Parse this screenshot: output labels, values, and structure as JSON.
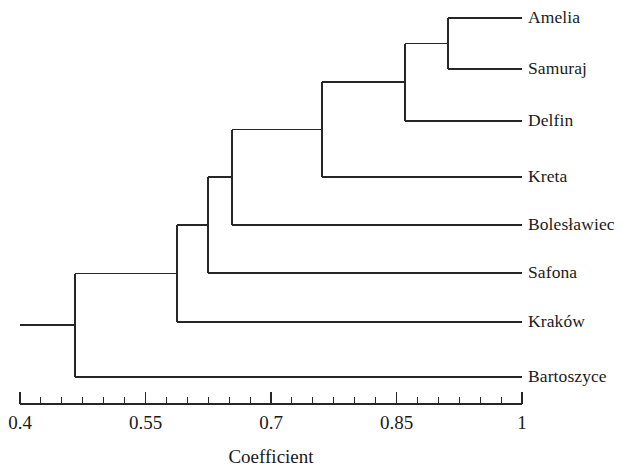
{
  "figure": {
    "type": "dendrogram",
    "axis_title": "Coefficient",
    "leaf_label_x": 528,
    "plot": {
      "axis_y": 404,
      "axis_x_start": 20,
      "axis_x_end": 522,
      "value_min": 0.4,
      "value_max": 1.0,
      "tick_step": 0.025,
      "major_tick_values": [
        0.4,
        0.55,
        0.7,
        0.85,
        1.0
      ],
      "major_tick_labels": [
        "0.4",
        "0.55",
        "0.7",
        "0.85",
        "1"
      ],
      "major_tick_length": 12,
      "minor_tick_length": 7,
      "axis_title_x": 271,
      "axis_title_y": 446
    }
  },
  "chart_data": {
    "type": "dendrogram",
    "title": "",
    "xlabel": "Coefficient",
    "ylabel": "",
    "xlim": [
      0.4,
      1.0
    ],
    "grid": false,
    "legend": "none",
    "tick_values": [
      0.4,
      0.425,
      0.45,
      0.475,
      0.5,
      0.525,
      0.55,
      0.575,
      0.6,
      0.625,
      0.65,
      0.675,
      0.7,
      0.725,
      0.75,
      0.775,
      0.8,
      0.825,
      0.85,
      0.875,
      0.9,
      0.925,
      0.95,
      0.975,
      1.0
    ],
    "labeled_ticks": [
      {
        "value": 0.4,
        "label": "0.4"
      },
      {
        "value": 0.55,
        "label": "0.55"
      },
      {
        "value": 0.7,
        "label": "0.7"
      },
      {
        "value": 0.85,
        "label": "0.85"
      },
      {
        "value": 1.0,
        "label": "1"
      }
    ],
    "leaves": [
      {
        "name": "Amelia",
        "y": 18
      },
      {
        "name": "Samuraj",
        "y": 69
      },
      {
        "name": "Delfin",
        "y": 121
      },
      {
        "name": "Kreta",
        "y": 177
      },
      {
        "name": "Bolesławiec",
        "y": 225
      },
      {
        "name": "Safona",
        "y": 273
      },
      {
        "name": "Kraków",
        "y": 322
      },
      {
        "name": "Bartoszyce",
        "y": 377
      }
    ],
    "leaf_tip_value": 1.0,
    "merges": [
      {
        "id": "n1",
        "members": [
          "Amelia",
          "Samuraj"
        ],
        "coefficient": 0.911,
        "x": 448,
        "y_top": 18,
        "y_bottom": 69,
        "y_mid": 43.5
      },
      {
        "id": "n2",
        "members": [
          "Amelia",
          "Samuraj",
          "Delfin"
        ],
        "coefficient": 0.86,
        "x": 405,
        "y_top": 43.5,
        "y_bottom": 121,
        "y_mid": 82
      },
      {
        "id": "n3",
        "members": [
          "Amelia",
          "Samuraj",
          "Delfin",
          "Kreta"
        ],
        "coefficient": 0.761,
        "x": 322,
        "y_top": 82,
        "y_bottom": 177,
        "y_mid": 129.5
      },
      {
        "id": "n4",
        "members": [
          "Amelia",
          "Samuraj",
          "Delfin",
          "Kreta",
          "Bolesławiec"
        ],
        "coefficient": 0.653,
        "x": 232,
        "y_top": 129.5,
        "y_bottom": 225,
        "y_mid": 177
      },
      {
        "id": "n5",
        "members": [
          "Amelia",
          "Samuraj",
          "Delfin",
          "Kreta",
          "Bolesławiec",
          "Safona"
        ],
        "coefficient": 0.625,
        "x": 208,
        "y_top": 177,
        "y_bottom": 273,
        "y_mid": 225
      },
      {
        "id": "n6",
        "members": [
          "Amelia",
          "Samuraj",
          "Delfin",
          "Kreta",
          "Bolesławiec",
          "Safona",
          "Kraków"
        ],
        "coefficient": 0.588,
        "x": 177,
        "y_top": 225,
        "y_bottom": 322,
        "y_mid": 273.5
      },
      {
        "id": "n7",
        "members": [
          "Amelia",
          "Samuraj",
          "Delfin",
          "Kreta",
          "Bolesławiec",
          "Safona",
          "Kraków",
          "Bartoszyce"
        ],
        "coefficient": 0.466,
        "x": 75,
        "y_top": 273.5,
        "y_bottom": 377,
        "y_mid": 325
      }
    ],
    "root_stub": {
      "x_from": 20,
      "x_to": 75,
      "y": 325
    }
  }
}
